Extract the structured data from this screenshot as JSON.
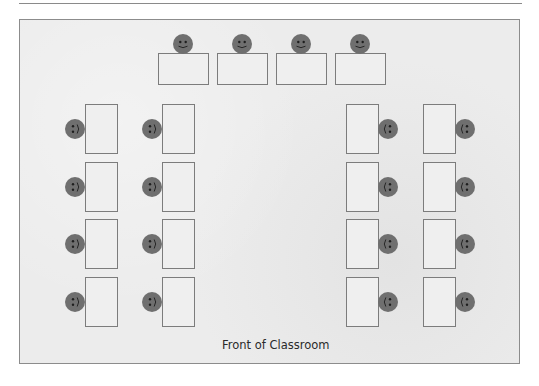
{
  "diagram": {
    "title": "Front of Classroom",
    "colors": {
      "room_fill": "#ececec",
      "room_border": "#8c8c8c",
      "desk_border": "#7c7c7c",
      "face_fill": "#6f6f6f",
      "face_features": "#1e1e1e"
    },
    "top_row": {
      "orientation": "horizontal",
      "face_position": "above",
      "desks": [
        {
          "x": 158,
          "y": 53
        },
        {
          "x": 217,
          "y": 53
        },
        {
          "x": 276,
          "y": 53
        },
        {
          "x": 335,
          "y": 53
        }
      ]
    },
    "left_columns": {
      "orientation": "vertical",
      "face_position": "left",
      "columns_x": [
        85,
        162
      ],
      "rows_y": [
        104,
        162,
        219,
        277
      ]
    },
    "right_columns": {
      "orientation": "vertical",
      "face_position": "right",
      "columns_x": [
        346,
        423
      ],
      "rows_y": [
        104,
        162,
        219,
        277
      ]
    },
    "counts": {
      "desks": 20,
      "students": 20
    }
  }
}
